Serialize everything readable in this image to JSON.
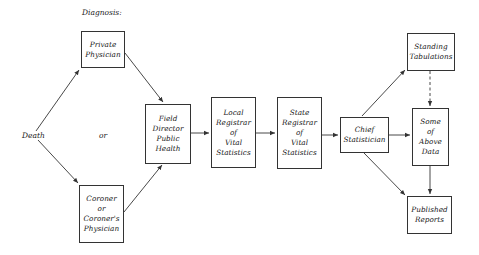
{
  "diagram": {
    "header_label": "Diagnosis:",
    "start_node": "Death",
    "or_label": "or",
    "colors": {
      "line": "#333333",
      "text": "#1a1a1a",
      "background": "#ffffff"
    },
    "nodes": {
      "private_physician": {
        "lines": [
          "Private",
          "Physician"
        ]
      },
      "coroner": {
        "lines": [
          "Coroner",
          "or",
          "Coroner's",
          "Physician"
        ]
      },
      "field_director": {
        "lines": [
          "Field",
          "Director",
          "Public",
          "Health"
        ]
      },
      "local_registrar": {
        "lines": [
          "Local",
          "Registrar",
          "of",
          "Vital",
          "Statistics"
        ]
      },
      "state_registrar": {
        "lines": [
          "State",
          "Registrar",
          "of",
          "Vital",
          "Statistics"
        ]
      },
      "chief_statistician": {
        "lines": [
          "Chief",
          "Statistician"
        ]
      },
      "standing_tabulations": {
        "lines": [
          "Standing",
          "Tabulations"
        ]
      },
      "some_above_data": {
        "lines": [
          "Some",
          "of",
          "Above",
          "Data"
        ]
      },
      "published_reports": {
        "lines": [
          "Published",
          "Reports"
        ]
      }
    },
    "edges": [
      {
        "from": "Death",
        "to": "Private Physician",
        "style": "solid"
      },
      {
        "from": "Death",
        "to": "Coroner or Coroner's Physician",
        "style": "solid"
      },
      {
        "from": "Private Physician",
        "to": "Field Director Public Health",
        "style": "solid"
      },
      {
        "from": "Coroner or Coroner's Physician",
        "to": "Field Director Public Health",
        "style": "solid"
      },
      {
        "from": "Field Director Public Health",
        "to": "Local Registrar of Vital Statistics",
        "style": "solid"
      },
      {
        "from": "Local Registrar of Vital Statistics",
        "to": "State Registrar of Vital Statistics",
        "style": "solid"
      },
      {
        "from": "State Registrar of Vital Statistics",
        "to": "Chief Statistician",
        "style": "solid"
      },
      {
        "from": "Chief Statistician",
        "to": "Standing Tabulations",
        "style": "solid"
      },
      {
        "from": "Chief Statistician",
        "to": "Some of Above Data",
        "style": "solid"
      },
      {
        "from": "Chief Statistician",
        "to": "Published Reports",
        "style": "solid"
      },
      {
        "from": "Standing Tabulations",
        "to": "Some of Above Data",
        "style": "dashed"
      },
      {
        "from": "Some of Above Data",
        "to": "Published Reports",
        "style": "solid"
      }
    ]
  }
}
